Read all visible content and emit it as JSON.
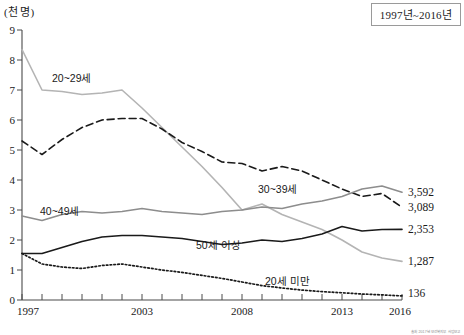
{
  "unit_label": "(천 명)",
  "title_box": "1997년~2016년",
  "source_note": "출처 2017년 보건복지부 사업보고",
  "axes": {
    "y_ticks": [
      "0",
      "1",
      "2",
      "3",
      "4",
      "5",
      "6",
      "7",
      "8",
      "9"
    ],
    "x_ticks_labeled": [
      "1997",
      "2003",
      "2008",
      "2013",
      "2016"
    ]
  },
  "series_labels": {
    "s20_29": "20~29세",
    "s30_39": "30~39세",
    "s40_49": "40~49세",
    "s50up": "50세 이상",
    "under20": "20세 미만"
  },
  "end_values": {
    "s40_49": "3,592",
    "s30_39": "3,089",
    "s50up": "2,353",
    "s20_29": "1,287",
    "under20": "136"
  },
  "chart_data": {
    "type": "line",
    "title": "1997년~2016년",
    "xlabel": "",
    "ylabel": "(천 명)",
    "ylim": [
      0,
      9
    ],
    "xlim": [
      1997,
      2016
    ],
    "grid": false,
    "legend": "inline-labels",
    "x": [
      1997,
      1998,
      1999,
      2000,
      2001,
      2002,
      2003,
      2004,
      2005,
      2006,
      2007,
      2008,
      2009,
      2010,
      2011,
      2012,
      2013,
      2014,
      2015,
      2016
    ],
    "series": [
      {
        "name": "20~29세",
        "style": "solid",
        "color": "#b4b4b4",
        "end_label": "1,287",
        "values": [
          8.35,
          7.0,
          6.95,
          6.85,
          6.9,
          7.0,
          6.4,
          5.75,
          5.1,
          4.45,
          3.75,
          3.0,
          3.2,
          2.85,
          2.6,
          2.35,
          2.0,
          1.6,
          1.4,
          1.287
        ]
      },
      {
        "name": "30~39세",
        "style": "dashed",
        "color": "#1a1a1a",
        "end_label": "3,089",
        "values": [
          5.3,
          4.85,
          5.35,
          5.75,
          6.0,
          6.05,
          6.05,
          5.7,
          5.25,
          4.95,
          4.6,
          4.55,
          4.3,
          4.45,
          4.3,
          4.0,
          3.7,
          3.45,
          3.55,
          3.089
        ]
      },
      {
        "name": "40~49세",
        "style": "solid",
        "color": "#8d8d8d",
        "end_label": "3,592",
        "values": [
          2.8,
          2.65,
          2.85,
          2.95,
          2.9,
          2.95,
          3.05,
          2.95,
          2.9,
          2.85,
          2.95,
          3.0,
          3.1,
          3.05,
          3.2,
          3.3,
          3.45,
          3.7,
          3.8,
          3.592
        ]
      },
      {
        "name": "50세 이상",
        "style": "solid",
        "color": "#1a1a1a",
        "end_label": "2,353",
        "values": [
          1.55,
          1.55,
          1.75,
          1.95,
          2.1,
          2.15,
          2.15,
          2.1,
          2.05,
          1.95,
          1.85,
          1.9,
          2.0,
          1.95,
          2.05,
          2.2,
          2.45,
          2.3,
          2.35,
          2.353
        ]
      },
      {
        "name": "20세 미만",
        "style": "dotted",
        "color": "#1a1a1a",
        "end_label": "136",
        "values": [
          1.55,
          1.2,
          1.1,
          1.05,
          1.15,
          1.2,
          1.1,
          1.0,
          0.92,
          0.82,
          0.72,
          0.6,
          0.48,
          0.4,
          0.33,
          0.28,
          0.24,
          0.2,
          0.17,
          0.136
        ]
      }
    ]
  }
}
